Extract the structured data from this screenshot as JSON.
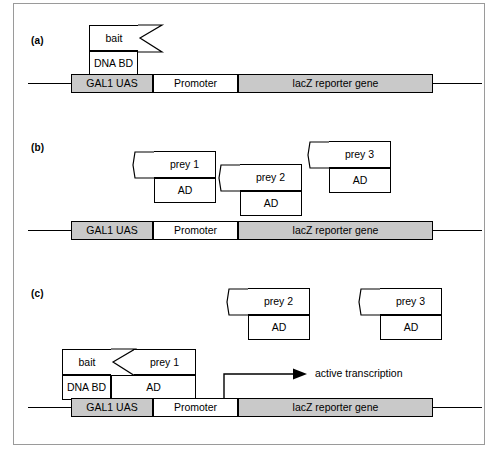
{
  "figure": {
    "caption_labels": {
      "a": "(a)",
      "b": "(b)",
      "c": "(c)"
    },
    "colors": {
      "segment_gray": "#c9c9c9",
      "segment_white": "#ffffff",
      "stroke": "#000000",
      "frame": "#9a9a9a"
    }
  },
  "dna_construct": {
    "segments": [
      {
        "id": "gal1-uas",
        "label": "GAL1 UAS",
        "fill": "gray"
      },
      {
        "id": "promoter",
        "label": "Promoter",
        "fill": "white"
      },
      {
        "id": "lacz",
        "label": "lacZ reporter gene",
        "fill": "gray"
      }
    ]
  },
  "panel_a": {
    "label": "(a)",
    "bait": {
      "top_label": "bait",
      "bottom_label": "DNA BD"
    }
  },
  "panel_b": {
    "label": "(b)",
    "preys": [
      {
        "top_label": "prey 1",
        "bottom_label": "AD"
      },
      {
        "top_label": "prey 2",
        "bottom_label": "AD"
      },
      {
        "top_label": "prey 3",
        "bottom_label": "AD"
      }
    ]
  },
  "panel_c": {
    "label": "(c)",
    "free_preys": [
      {
        "top_label": "prey 2",
        "bottom_label": "AD"
      },
      {
        "top_label": "prey 3",
        "bottom_label": "AD"
      }
    ],
    "complex": {
      "bait_top_label": "bait",
      "bait_bottom_label": "DNA BD",
      "prey_top_label": "prey 1",
      "prey_bottom_label": "AD"
    },
    "transcription_label": "active transcription"
  }
}
